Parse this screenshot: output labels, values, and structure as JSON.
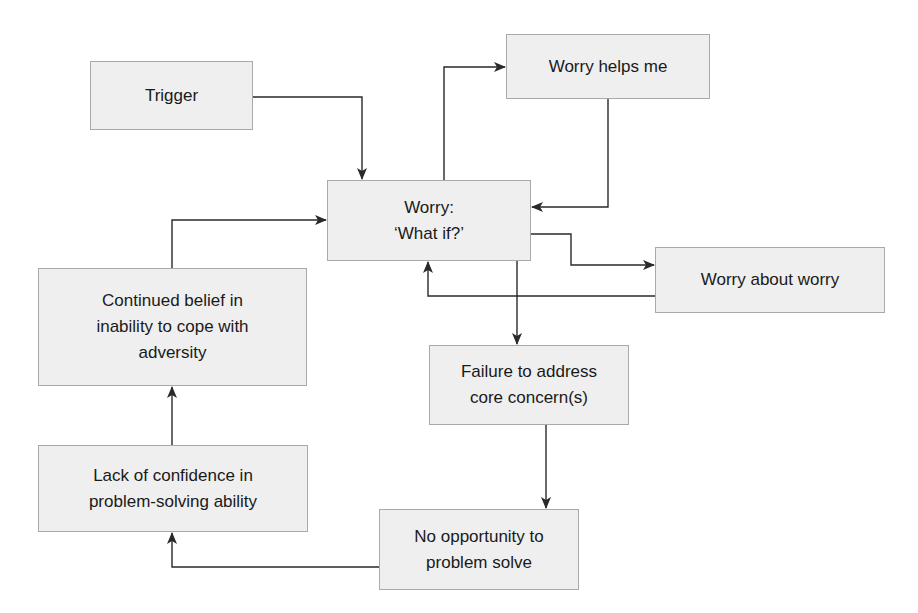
{
  "diagram": {
    "type": "flowchart",
    "colors": {
      "node_fill": "#efefef",
      "node_border": "#a9a9a9",
      "edge": "#2a2a2a",
      "text": "#1a1a1a"
    },
    "nodes": {
      "trigger": {
        "lines": [
          "Trigger"
        ]
      },
      "worry": {
        "lines": [
          "Worry:",
          "‘What if?’"
        ]
      },
      "worry_helps": {
        "lines": [
          "Worry helps me"
        ]
      },
      "worry_about_worry": {
        "lines": [
          "Worry about worry"
        ]
      },
      "continued_belief": {
        "lines": [
          "Continued belief in",
          "inability to cope with",
          "adversity"
        ]
      },
      "failure": {
        "lines": [
          "Failure to address",
          "core concern(s)"
        ]
      },
      "lack_confidence": {
        "lines": [
          "Lack of confidence in",
          "problem-solving ability"
        ]
      },
      "no_opportunity": {
        "lines": [
          "No opportunity to",
          "problem solve"
        ]
      }
    },
    "edges": [
      {
        "from": "Trigger",
        "to": "Worry: ‘What if?’"
      },
      {
        "from": "Worry: ‘What if?’",
        "to": "Worry helps me"
      },
      {
        "from": "Worry helps me",
        "to": "Worry: ‘What if?’"
      },
      {
        "from": "Worry: ‘What if?’",
        "to": "Worry about worry"
      },
      {
        "from": "Worry about worry",
        "to": "Worry: ‘What if?’"
      },
      {
        "from": "Worry: ‘What if?’",
        "to": "Failure to address core concern(s)"
      },
      {
        "from": "Failure to address core concern(s)",
        "to": "No opportunity to problem solve"
      },
      {
        "from": "No opportunity to problem solve",
        "to": "Lack of confidence in problem-solving ability"
      },
      {
        "from": "Lack of confidence in problem-solving ability",
        "to": "Continued belief in inability to cope with adversity"
      },
      {
        "from": "Continued belief in inability to cope with adversity",
        "to": "Worry: ‘What if?’"
      }
    ]
  }
}
